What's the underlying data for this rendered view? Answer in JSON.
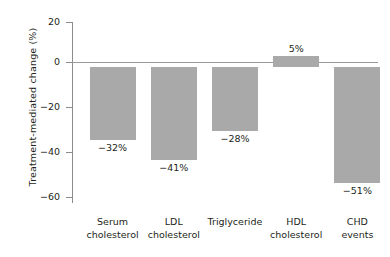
{
  "chart_data": {
    "type": "bar",
    "title": "",
    "xlabel": "",
    "ylabel": "Treatment-mediated change (%)",
    "ylim": [
      -60,
      20
    ],
    "yticks": [
      20,
      0,
      -20,
      -40,
      -60
    ],
    "ytick_labels": [
      "20",
      "0",
      "−20",
      "−40",
      "−60"
    ],
    "grid": false,
    "legend": null,
    "baseline": 0,
    "categories": [
      "Serum cholesterol",
      "LDL cholesterol",
      "Triglyceride",
      "HDL cholesterol",
      "CHD events"
    ],
    "category_lines": [
      [
        "Serum",
        "cholesterol"
      ],
      [
        "LDL",
        "cholesterol"
      ],
      [
        "Triglyceride",
        ""
      ],
      [
        "HDL",
        "cholesterol"
      ],
      [
        "CHD",
        "events"
      ]
    ],
    "values": [
      -32,
      -41,
      -28,
      5,
      -51
    ],
    "data_labels": [
      "−32%",
      "−41%",
      "−28%",
      "5%",
      "−51%"
    ],
    "bar_color": "#a9a9a9",
    "axis_color": "#8c8c8c",
    "text_color": "#231f20"
  },
  "axis": {
    "y_title": "Treatment-mediated change (%)",
    "ticks": [
      {
        "label": "20"
      },
      {
        "label": "0"
      },
      {
        "label": "−20"
      },
      {
        "label": "−40"
      },
      {
        "label": "−60"
      }
    ]
  },
  "bars": [
    {
      "label": "−32%",
      "line1": "Serum",
      "line2": "cholesterol"
    },
    {
      "label": "−41%",
      "line1": "LDL",
      "line2": "cholesterol"
    },
    {
      "label": "−28%",
      "line1": "Triglyceride",
      "line2": ""
    },
    {
      "label": "5%",
      "line1": "HDL",
      "line2": "cholesterol"
    },
    {
      "label": "−51%",
      "line1": "CHD",
      "line2": "events"
    }
  ]
}
